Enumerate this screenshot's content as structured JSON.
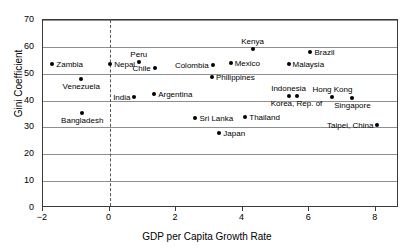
{
  "chart_data": {
    "type": "scatter",
    "title": "",
    "xlabel": "GDP per Capita Growth Rate",
    "ylabel": "Gini Coefficient",
    "xlim": [
      -2,
      8.7
    ],
    "ylim": [
      0,
      70
    ],
    "xticks": [
      -2,
      0,
      2,
      4,
      6,
      8
    ],
    "xtick_labels": [
      "−2",
      "0",
      "2",
      "4",
      "6",
      "8"
    ],
    "yticks": [
      0,
      10,
      20,
      30,
      40,
      50,
      60,
      70
    ],
    "ytick_labels": [
      "0",
      "10",
      "20",
      "30",
      "40",
      "50",
      "60",
      "70"
    ],
    "grid": "horizontal gridlines at each y tick",
    "legend": "none",
    "annotations": [
      {
        "type": "vertical-dashed-line",
        "x": 0
      }
    ],
    "point_color": "#000000",
    "points": [
      {
        "label": "Zambia",
        "x": -1.72,
        "y": 53.7,
        "label_pos": "right"
      },
      {
        "label": "Venezuela",
        "x": -0.85,
        "y": 48.0,
        "label_pos": "below"
      },
      {
        "label": "Bangladesh",
        "x": -0.82,
        "y": 35.5,
        "label_pos": "below"
      },
      {
        "label": "Nepal",
        "x": 0.02,
        "y": 53.7,
        "label_pos": "right"
      },
      {
        "label": "Peru",
        "x": 0.88,
        "y": 54.3,
        "label_pos": "above"
      },
      {
        "label": "Chile",
        "x": 1.36,
        "y": 52.2,
        "label_pos": "left"
      },
      {
        "label": "India",
        "x": 0.75,
        "y": 41.3,
        "label_pos": "left"
      },
      {
        "label": "Argentina",
        "x": 1.34,
        "y": 42.3,
        "label_pos": "right"
      },
      {
        "label": "Colombia",
        "x": 3.1,
        "y": 53.1,
        "label_pos": "left"
      },
      {
        "label": "Mexico",
        "x": 3.64,
        "y": 53.9,
        "label_pos": "right"
      },
      {
        "label": "Philippines",
        "x": 3.08,
        "y": 48.9,
        "label_pos": "right"
      },
      {
        "label": "Kenya",
        "x": 4.3,
        "y": 59.2,
        "label_pos": "above"
      },
      {
        "label": "Brazil",
        "x": 6.04,
        "y": 58.0,
        "label_pos": "right"
      },
      {
        "label": "Malaysia",
        "x": 5.38,
        "y": 53.8,
        "label_pos": "right"
      },
      {
        "label": "Indonesia",
        "x": 5.38,
        "y": 41.7,
        "label_pos": "above"
      },
      {
        "label": "Korea, Rep. of",
        "x": 5.62,
        "y": 41.7,
        "label_pos": "below"
      },
      {
        "label": "Hong Kong",
        "x": 6.7,
        "y": 41.2,
        "label_pos": "above"
      },
      {
        "label": "Singapore",
        "x": 7.3,
        "y": 40.8,
        "label_pos": "below"
      },
      {
        "label": "Sri Lanka",
        "x": 2.58,
        "y": 33.6,
        "label_pos": "right"
      },
      {
        "label": "Thailand",
        "x": 4.08,
        "y": 34.0,
        "label_pos": "right"
      },
      {
        "label": "Japan",
        "x": 3.3,
        "y": 28.0,
        "label_pos": "right"
      },
      {
        "label": "Taipei, China",
        "x": 8.05,
        "y": 30.9,
        "label_pos": "left"
      }
    ]
  }
}
